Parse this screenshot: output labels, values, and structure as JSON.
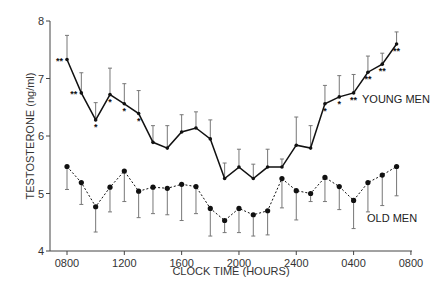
{
  "chart_data": {
    "type": "line",
    "title": "",
    "xlabel": "CLOCK TIME   (HOURS)",
    "ylabel": "TESTOSTERONE   (ng/ml)",
    "ylim": [
      4,
      8
    ],
    "yticks": [
      4,
      5,
      6,
      7,
      8
    ],
    "xtick_labels": [
      "0800",
      "1200",
      "1600",
      "2000",
      "2400",
      "0400",
      "0800"
    ],
    "grid": false,
    "x": [
      "0800",
      "0900",
      "1000",
      "1100",
      "1200",
      "1300",
      "1400",
      "1500",
      "1600",
      "1700",
      "1800",
      "1900",
      "2000",
      "2100",
      "2200",
      "2300",
      "2400",
      "0100",
      "0200",
      "0300",
      "0400",
      "0500",
      "0600",
      "0700"
    ],
    "series": [
      {
        "name": "YOUNG MEN",
        "style": "solid",
        "values": [
          7.33,
          6.75,
          6.28,
          6.72,
          6.56,
          6.39,
          5.89,
          5.79,
          6.07,
          6.14,
          5.95,
          5.26,
          5.46,
          5.26,
          5.46,
          5.46,
          5.84,
          5.79,
          6.56,
          6.68,
          6.75,
          7.11,
          7.25,
          7.6
        ],
        "error_upper": [
          7.75,
          7.1,
          6.58,
          7.18,
          6.91,
          6.79,
          6.18,
          6.18,
          6.37,
          6.42,
          6.28,
          5.53,
          5.77,
          5.51,
          5.77,
          5.6,
          6.33,
          6.18,
          6.88,
          7.05,
          7.07,
          7.39,
          7.44,
          7.81
        ],
        "significance": [
          "**",
          "**",
          "*",
          "*",
          "*",
          "*",
          "",
          "",
          "",
          "",
          "",
          "",
          "",
          "",
          "",
          "",
          "",
          "",
          "*",
          "*",
          "**",
          "**",
          "**",
          "**"
        ]
      },
      {
        "name": "OLD MEN",
        "style": "dotted",
        "values": [
          5.47,
          5.19,
          4.77,
          5.11,
          5.39,
          5.04,
          5.11,
          5.09,
          5.16,
          5.12,
          4.74,
          4.53,
          4.74,
          4.63,
          4.7,
          5.26,
          5.05,
          5.0,
          5.28,
          5.12,
          4.88,
          5.19,
          5.32,
          5.47
        ],
        "error_lower": [
          5.07,
          4.81,
          4.33,
          4.68,
          4.86,
          4.58,
          4.65,
          4.63,
          4.53,
          4.65,
          4.26,
          4.32,
          4.32,
          4.26,
          4.28,
          4.75,
          4.54,
          4.86,
          4.86,
          4.72,
          4.39,
          4.68,
          4.79,
          4.96
        ]
      }
    ],
    "annotations": [
      "YOUNG MEN",
      "OLD MEN"
    ]
  }
}
